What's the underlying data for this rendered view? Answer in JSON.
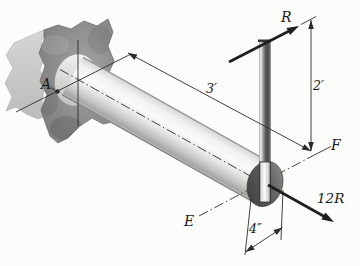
{
  "labels": {
    "point_a": "A",
    "point_e": "E",
    "point_f": "F",
    "force_r": "R",
    "force_12r": "12R",
    "dim_length": "3′",
    "dim_height": "2′",
    "dim_diameter": "4″"
  },
  "colors": {
    "paper": "#fcfcfa",
    "line": "#2b2b2b",
    "bold_line": "#1f1f1f",
    "wall_face": "#8e8e8c",
    "wall_side": "#cac9c7",
    "shaft_end_dark": "#4a4a4a"
  }
}
